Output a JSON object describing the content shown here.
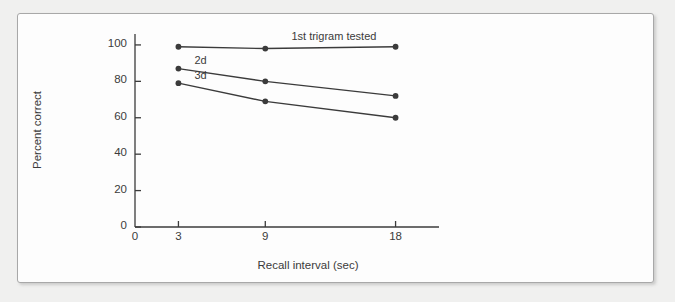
{
  "figure": {
    "background_color": "#f0f0ef",
    "panel_color": "#fdfdfd",
    "border_color": "#a8a8a8",
    "ink_color": "#3b3b3b"
  },
  "chart_data": {
    "type": "line",
    "title": "",
    "xlabel": "Recall interval (sec)",
    "ylabel": "Percent correct",
    "x": [
      3,
      9,
      18
    ],
    "xlim": [
      0,
      21
    ],
    "ylim": [
      0,
      106
    ],
    "xticks": [
      0,
      3,
      9,
      18
    ],
    "xticklabels": [
      "0",
      "3",
      "9",
      "18"
    ],
    "yticks": [
      0,
      20,
      40,
      60,
      80,
      100
    ],
    "yticklabels": [
      "0",
      "20",
      "40",
      "60",
      "80",
      "100"
    ],
    "grid": false,
    "legend_position": "inline-above-line",
    "marker": "filled-circle",
    "series": [
      {
        "name": "1st trigram tested",
        "label": "1st trigram tested",
        "values": [
          99,
          98,
          99
        ]
      },
      {
        "name": "2d",
        "label": "2d",
        "values": [
          87,
          80,
          72
        ]
      },
      {
        "name": "3d",
        "label": "3d",
        "values": [
          79,
          69,
          60
        ]
      }
    ]
  }
}
